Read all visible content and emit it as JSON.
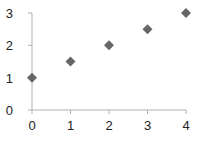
{
  "chart_data": {
    "type": "scatter",
    "title": "",
    "xlabel": "",
    "ylabel": "",
    "x": [
      0,
      1,
      2,
      3,
      4
    ],
    "series": [
      {
        "name": "Series 1",
        "values": [
          1,
          1.5,
          2,
          2.5,
          3
        ],
        "marker": "diamond",
        "color": "#666666"
      }
    ],
    "xlim": [
      0,
      4
    ],
    "ylim": [
      0,
      3
    ],
    "xticks": [
      "0",
      "1",
      "2",
      "3",
      "4"
    ],
    "yticks": [
      "0",
      "1",
      "2",
      "3"
    ],
    "grid": false,
    "legend": "none"
  },
  "colors": {
    "axis": "#b0b0b0",
    "marker": "#666666",
    "text": "#222222"
  }
}
